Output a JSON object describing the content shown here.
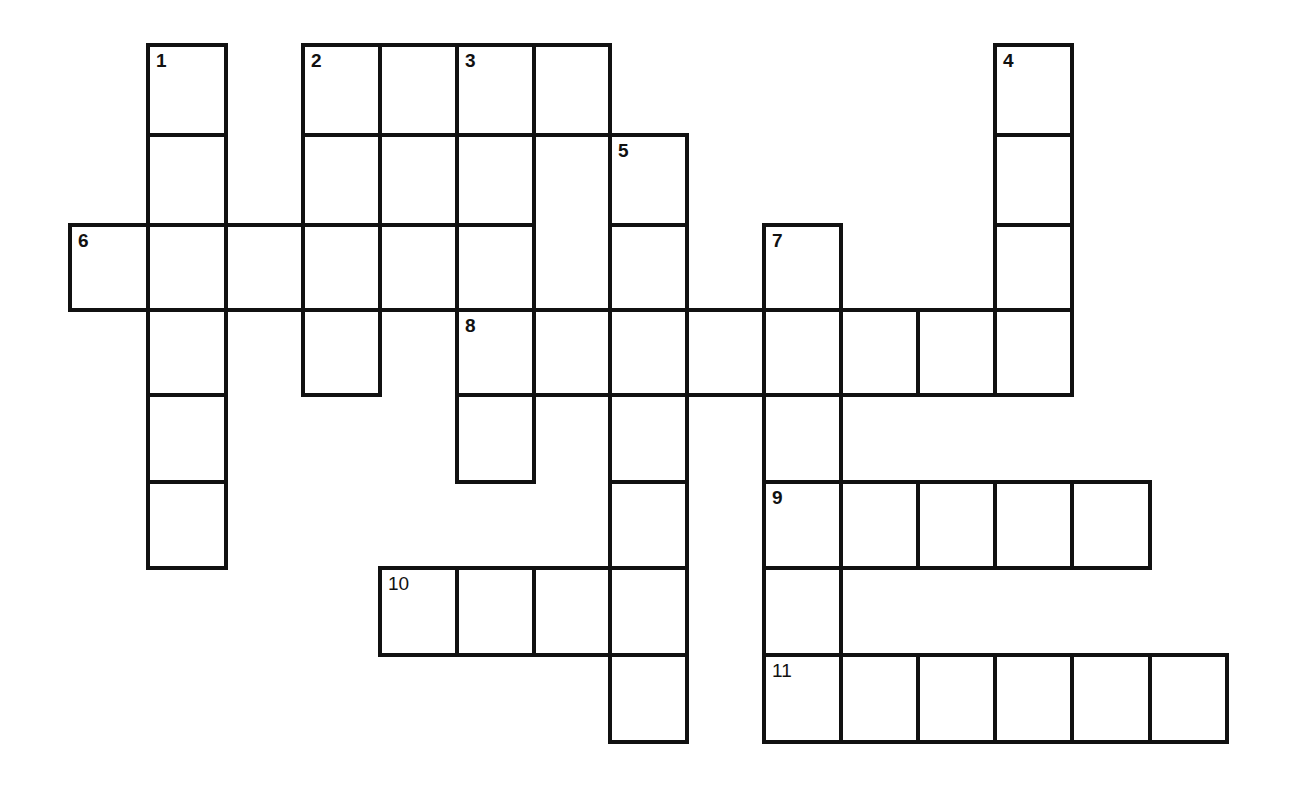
{
  "puzzle": {
    "type": "crossword",
    "grid": {
      "col_x": [
        70,
        148,
        226,
        303,
        380,
        457,
        534,
        610,
        687,
        764,
        841,
        918,
        995,
        1072,
        1150,
        1227
      ],
      "row_y": [
        45,
        135,
        225,
        310,
        395,
        482,
        568,
        655,
        742
      ]
    },
    "cells": [
      {
        "c": 1,
        "r": 0,
        "n": "1"
      },
      {
        "c": 1,
        "r": 1
      },
      {
        "c": 1,
        "r": 2
      },
      {
        "c": 1,
        "r": 3
      },
      {
        "c": 1,
        "r": 4
      },
      {
        "c": 1,
        "r": 5
      },
      {
        "c": 3,
        "r": 0,
        "n": "2"
      },
      {
        "c": 4,
        "r": 0
      },
      {
        "c": 5,
        "r": 0,
        "n": "3"
      },
      {
        "c": 6,
        "r": 0
      },
      {
        "c": 3,
        "r": 1
      },
      {
        "c": 4,
        "r": 1
      },
      {
        "c": 5,
        "r": 1
      },
      {
        "c": 6,
        "r": 1,
        "h": 2
      },
      {
        "c": 7,
        "r": 1,
        "n": "5"
      },
      {
        "c": 0,
        "r": 2,
        "n": "6"
      },
      {
        "c": 2,
        "r": 2
      },
      {
        "c": 3,
        "r": 2
      },
      {
        "c": 4,
        "r": 2
      },
      {
        "c": 5,
        "r": 2
      },
      {
        "c": 7,
        "r": 2
      },
      {
        "c": 9,
        "r": 2,
        "n": "7"
      },
      {
        "c": 12,
        "r": 0,
        "n": "4"
      },
      {
        "c": 12,
        "r": 1
      },
      {
        "c": 12,
        "r": 2
      },
      {
        "c": 3,
        "r": 3
      },
      {
        "c": 5,
        "r": 3,
        "n": "8"
      },
      {
        "c": 6,
        "r": 3
      },
      {
        "c": 7,
        "r": 3
      },
      {
        "c": 8,
        "r": 3
      },
      {
        "c": 9,
        "r": 3
      },
      {
        "c": 10,
        "r": 3
      },
      {
        "c": 11,
        "r": 3
      },
      {
        "c": 12,
        "r": 3
      },
      {
        "c": 5,
        "r": 4
      },
      {
        "c": 7,
        "r": 4
      },
      {
        "c": 9,
        "r": 4
      },
      {
        "c": 7,
        "r": 5
      },
      {
        "c": 9,
        "r": 5,
        "n": "9"
      },
      {
        "c": 10,
        "r": 5
      },
      {
        "c": 11,
        "r": 5
      },
      {
        "c": 12,
        "r": 5
      },
      {
        "c": 13,
        "r": 5
      },
      {
        "c": 4,
        "r": 6,
        "n": "10",
        "thin": true
      },
      {
        "c": 5,
        "r": 6
      },
      {
        "c": 6,
        "r": 6
      },
      {
        "c": 7,
        "r": 6
      },
      {
        "c": 9,
        "r": 6
      },
      {
        "c": 7,
        "r": 7
      },
      {
        "c": 9,
        "r": 7,
        "n": "11",
        "thin": true
      },
      {
        "c": 10,
        "r": 7
      },
      {
        "c": 11,
        "r": 7
      },
      {
        "c": 12,
        "r": 7
      },
      {
        "c": 13,
        "r": 7
      },
      {
        "c": 14,
        "r": 7
      }
    ],
    "clue_numbers": [
      "1",
      "2",
      "3",
      "4",
      "5",
      "6",
      "7",
      "8",
      "9",
      "10",
      "11"
    ],
    "border_color": "#111111",
    "background": "#ffffff"
  }
}
